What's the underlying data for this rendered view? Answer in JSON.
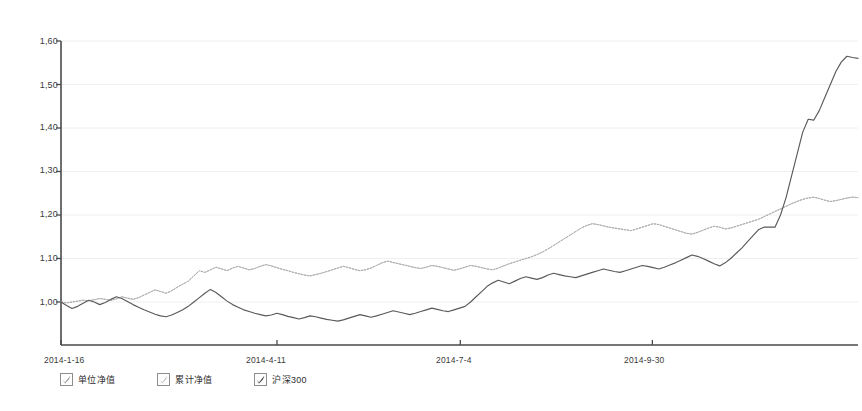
{
  "chart_data": {
    "type": "line",
    "title": "",
    "subtitle": "",
    "xlabel": "",
    "ylabel": "",
    "ylim": [
      0.93,
      1.6
    ],
    "yticks": [
      1.0,
      1.1,
      1.2,
      1.3,
      1.4,
      1.5,
      1.6
    ],
    "ytick_labels": [
      "1,00",
      "1,10",
      "1,20",
      "1,30",
      "1,40",
      "1,50",
      "1,60"
    ],
    "xticks": [
      "2014-1-16",
      "2014-4-11",
      "2014-7-4",
      "2014-9-30"
    ],
    "xtick_positions": [
      0,
      0.271,
      0.501,
      0.742
    ],
    "grid": true,
    "grid_axis": "y",
    "legend_position": "bottom-left",
    "x_start": "2014-1-16",
    "x_end": "2014-12-19",
    "series": [
      {
        "name": "单位净值",
        "style": "dotted",
        "color": "#9a9a9a",
        "visible": true,
        "final_value": 1.24,
        "values": [
          1.0,
          0.998,
          1.0,
          1.002,
          1.004,
          1.003,
          1.005,
          1.008,
          1.006,
          1.004,
          1.007,
          1.012,
          1.009,
          1.006,
          1.01,
          1.016,
          1.022,
          1.028,
          1.024,
          1.02,
          1.026,
          1.034,
          1.041,
          1.048,
          1.06,
          1.072,
          1.068,
          1.074,
          1.08,
          1.076,
          1.072,
          1.078,
          1.082,
          1.078,
          1.074,
          1.077,
          1.082,
          1.086,
          1.083,
          1.079,
          1.075,
          1.072,
          1.068,
          1.065,
          1.062,
          1.06,
          1.063,
          1.066,
          1.07,
          1.074,
          1.078,
          1.082,
          1.079,
          1.075,
          1.072,
          1.074,
          1.078,
          1.084,
          1.09,
          1.094,
          1.091,
          1.088,
          1.085,
          1.082,
          1.079,
          1.077,
          1.08,
          1.084,
          1.082,
          1.079,
          1.076,
          1.073,
          1.076,
          1.08,
          1.084,
          1.082,
          1.079,
          1.076,
          1.074,
          1.078,
          1.083,
          1.088,
          1.092,
          1.096,
          1.1,
          1.104,
          1.109,
          1.115,
          1.122,
          1.13,
          1.138,
          1.146,
          1.154,
          1.162,
          1.17,
          1.176,
          1.18,
          1.178,
          1.175,
          1.172,
          1.17,
          1.168,
          1.166,
          1.164,
          1.168,
          1.172,
          1.176,
          1.18,
          1.178,
          1.174,
          1.17,
          1.166,
          1.162,
          1.158,
          1.156,
          1.16,
          1.165,
          1.17,
          1.174,
          1.172,
          1.168,
          1.17,
          1.174,
          1.178,
          1.182,
          1.186,
          1.19,
          1.196,
          1.202,
          1.208,
          1.214,
          1.22,
          1.226,
          1.231,
          1.236,
          1.239,
          1.241,
          1.238,
          1.234,
          1.231,
          1.233,
          1.236,
          1.239,
          1.241,
          1.24
        ]
      },
      {
        "name": "累计净值",
        "style": "dotted",
        "color": "#b4b4b4",
        "visible": true,
        "final_value": 1.24,
        "values": [
          1.0,
          0.998,
          1.0,
          1.002,
          1.004,
          1.003,
          1.005,
          1.008,
          1.006,
          1.004,
          1.007,
          1.012,
          1.009,
          1.006,
          1.01,
          1.016,
          1.022,
          1.028,
          1.024,
          1.02,
          1.026,
          1.034,
          1.041,
          1.048,
          1.06,
          1.072,
          1.068,
          1.074,
          1.08,
          1.076,
          1.072,
          1.078,
          1.082,
          1.078,
          1.074,
          1.077,
          1.082,
          1.086,
          1.083,
          1.079,
          1.075,
          1.072,
          1.068,
          1.065,
          1.062,
          1.06,
          1.063,
          1.066,
          1.07,
          1.074,
          1.078,
          1.082,
          1.079,
          1.075,
          1.072,
          1.074,
          1.078,
          1.084,
          1.09,
          1.094,
          1.091,
          1.088,
          1.085,
          1.082,
          1.079,
          1.077,
          1.08,
          1.084,
          1.082,
          1.079,
          1.076,
          1.073,
          1.076,
          1.08,
          1.084,
          1.082,
          1.079,
          1.076,
          1.074,
          1.078,
          1.083,
          1.088,
          1.092,
          1.096,
          1.1,
          1.104,
          1.109,
          1.115,
          1.122,
          1.13,
          1.138,
          1.146,
          1.154,
          1.162,
          1.17,
          1.176,
          1.18,
          1.178,
          1.175,
          1.172,
          1.17,
          1.168,
          1.166,
          1.164,
          1.168,
          1.172,
          1.176,
          1.18,
          1.178,
          1.174,
          1.17,
          1.166,
          1.162,
          1.158,
          1.156,
          1.16,
          1.165,
          1.17,
          1.174,
          1.172,
          1.168,
          1.17,
          1.174,
          1.178,
          1.182,
          1.186,
          1.19,
          1.196,
          1.202,
          1.208,
          1.214,
          1.22,
          1.226,
          1.231,
          1.236,
          1.239,
          1.241,
          1.238,
          1.234,
          1.231,
          1.233,
          1.236,
          1.239,
          1.241,
          1.24
        ]
      },
      {
        "name": "沪深300",
        "style": "solid",
        "color": "#5a5a5a",
        "visible": true,
        "final_value": 1.56,
        "values": [
          1.0,
          0.992,
          0.985,
          0.99,
          0.997,
          1.004,
          1.0,
          0.994,
          0.999,
          1.006,
          1.012,
          1.008,
          1.001,
          0.994,
          0.988,
          0.982,
          0.977,
          0.972,
          0.968,
          0.966,
          0.97,
          0.976,
          0.982,
          0.99,
          1.0,
          1.01,
          1.02,
          1.029,
          1.022,
          1.012,
          1.002,
          0.994,
          0.988,
          0.982,
          0.978,
          0.974,
          0.971,
          0.968,
          0.97,
          0.974,
          0.971,
          0.967,
          0.964,
          0.961,
          0.964,
          0.968,
          0.966,
          0.963,
          0.96,
          0.958,
          0.956,
          0.959,
          0.963,
          0.967,
          0.971,
          0.968,
          0.965,
          0.968,
          0.972,
          0.976,
          0.98,
          0.977,
          0.974,
          0.971,
          0.974,
          0.978,
          0.982,
          0.986,
          0.983,
          0.98,
          0.978,
          0.982,
          0.986,
          0.99,
          1.0,
          1.012,
          1.024,
          1.036,
          1.044,
          1.05,
          1.046,
          1.042,
          1.048,
          1.054,
          1.058,
          1.055,
          1.052,
          1.056,
          1.062,
          1.066,
          1.063,
          1.06,
          1.058,
          1.056,
          1.06,
          1.064,
          1.068,
          1.072,
          1.076,
          1.073,
          1.07,
          1.068,
          1.072,
          1.076,
          1.08,
          1.084,
          1.082,
          1.079,
          1.076,
          1.08,
          1.085,
          1.09,
          1.096,
          1.102,
          1.108,
          1.105,
          1.1,
          1.094,
          1.088,
          1.083,
          1.09,
          1.1,
          1.112,
          1.124,
          1.138,
          1.152,
          1.166,
          1.172,
          1.172,
          1.172,
          1.2,
          1.24,
          1.29,
          1.34,
          1.39,
          1.42,
          1.418,
          1.44,
          1.47,
          1.5,
          1.53,
          1.552,
          1.565,
          1.562,
          1.56
        ]
      }
    ]
  },
  "legend": {
    "items": [
      {
        "label": "单位净值",
        "checked": true,
        "swatch": "#8d8d8d"
      },
      {
        "label": "累计净值",
        "checked": true,
        "swatch": "#b0b0b0"
      },
      {
        "label": "沪深300",
        "checked": true,
        "swatch": "#3a3a3a"
      }
    ]
  },
  "axis": {
    "y_labels": [
      "1,60",
      "1,50",
      "1,40",
      "1,30",
      "1,20",
      "1,10",
      "1,00"
    ],
    "x_labels": [
      "2014-1-16",
      "2014-4-11",
      "2014-7-4",
      "2014-9-30"
    ]
  }
}
